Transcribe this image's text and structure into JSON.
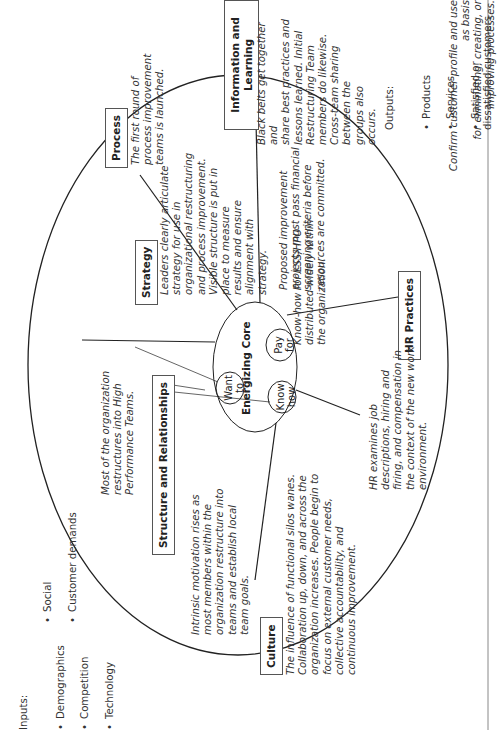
{
  "inputs": {
    "heading": "Inputs:",
    "col1": [
      "Demographics",
      "Competition",
      "Technology"
    ],
    "col2": [
      "Social",
      "Customer demands"
    ]
  },
  "outputs": {
    "heading": "Outputs:",
    "items": [
      "Products",
      "Services",
      "Satisfied or\ndissatisfied customers"
    ]
  },
  "footer_note": "Confirm customer profile and use as basis\nfor eliminating, creating, or improving processes.",
  "core": {
    "title": "Energizing Core",
    "want_to": "Want\nto",
    "know_how": "Know\nhow",
    "pay_for": "Pay\nfor",
    "know_how_note": "Know-how for LSS/HPO\ndistributed widely within\nthe organization.",
    "pay_for_note": "Proposed improvement\nprojects must pass financial\nscreening criteria before\nresources are committed."
  },
  "nodes": {
    "strategy": {
      "label": "Strategy",
      "text": "Leaders clearly articulate\nstrategy for use in\norganizational restructuring\nand process improvement.\nVisible structure is put in\nplace to measure\nresults and ensure\nalignment with\nstrategy."
    },
    "process": {
      "label": "Process",
      "text": "The first round of\nprocess improvement\nteams is launched."
    },
    "info_learning": {
      "label": "Information\nand Learning",
      "text": "Black belts get together and\nshare best practices and\nlessons learned. Initial\nRestructuring Team\nmembers do likewise.\nCross-team sharing\nbetween the\ngroups also\noccurs."
    },
    "hr": {
      "label": "HR\nPractices",
      "text": "HR examines job\ndescriptions, hiring and\nfiring, and compensation in\nthe context of the new work\nenvironment."
    },
    "culture": {
      "label": "Culture",
      "text": "The influence of functional silos wanes.\nCollaboration up, down, and across the\norganization increases. People begin to\nfocus on external customer needs,\ncollective accountability, and\ncontinuous improvement."
    },
    "structure": {
      "label": "Structure and\nRelationships",
      "text": "Intrinsic motivation rises as\nmost members within the\norganization restructure into\nteams and establish local\nteam goals."
    },
    "hpt_note": "Most of the organization\nrestructures into High\nPerformance Teams."
  }
}
